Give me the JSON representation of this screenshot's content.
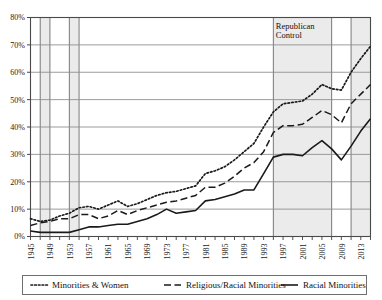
{
  "chart_data": {
    "type": "line",
    "title": "",
    "xlabel": "",
    "ylabel": "",
    "ylim": [
      0,
      80
    ],
    "xlim": [
      1945,
      2015
    ],
    "grid": true,
    "legend_position": "bottom",
    "ytick_labels": [
      "0%",
      "10%",
      "20%",
      "30%",
      "40%",
      "50%",
      "60%",
      "70%",
      "80%"
    ],
    "ytick_values": [
      0,
      10,
      20,
      30,
      40,
      50,
      60,
      70,
      80
    ],
    "xtick_labels": [
      "1945",
      "1949",
      "1953",
      "1957",
      "1961",
      "1965",
      "1969",
      "1973",
      "1977",
      "1981",
      "1985",
      "1989",
      "1993",
      "1997",
      "2001",
      "2005",
      "2009",
      "2013"
    ],
    "xtick_values": [
      1945,
      1949,
      1953,
      1957,
      1961,
      1965,
      1969,
      1973,
      1977,
      1981,
      1985,
      1989,
      1993,
      1997,
      2001,
      2005,
      2009,
      2013
    ],
    "x": [
      1945,
      1947,
      1949,
      1951,
      1953,
      1955,
      1957,
      1959,
      1961,
      1963,
      1965,
      1967,
      1969,
      1971,
      1973,
      1975,
      1977,
      1979,
      1981,
      1983,
      1985,
      1987,
      1989,
      1991,
      1993,
      1995,
      1997,
      1999,
      2001,
      2003,
      2005,
      2007,
      2009,
      2011,
      2013,
      2015
    ],
    "annotations": [
      {
        "text": "Republican Control",
        "x": 1995,
        "y": 78
      }
    ],
    "shaded_bands": [
      {
        "start": 1947,
        "end": 1949,
        "label": "Republican Control"
      },
      {
        "start": 1953,
        "end": 1955,
        "label": "Republican Control"
      },
      {
        "start": 1995,
        "end": 2007,
        "label": "Republican Control"
      },
      {
        "start": 2011,
        "end": 2015,
        "label": "Republican Control"
      }
    ],
    "series": [
      {
        "name": "Minorities & Women",
        "style": "dotted",
        "values": [
          6.5,
          5.5,
          6.0,
          7.5,
          8.5,
          10.5,
          11.0,
          10.0,
          11.5,
          13.0,
          11.0,
          12.0,
          13.5,
          15.0,
          16.0,
          16.5,
          17.5,
          18.5,
          23.0,
          24.0,
          25.5,
          28.0,
          31.0,
          34.0,
          40.0,
          45.5,
          48.5,
          49.0,
          49.5,
          52.0,
          55.5,
          54.0,
          53.5,
          60.0,
          65.0,
          69.5
        ]
      },
      {
        "name": "Religious/Racial Minorities",
        "style": "dashed",
        "values": [
          4.0,
          5.0,
          5.5,
          6.5,
          6.5,
          8.0,
          8.0,
          6.5,
          7.5,
          9.5,
          8.0,
          9.5,
          10.5,
          11.5,
          12.5,
          13.0,
          14.0,
          15.0,
          18.0,
          18.0,
          19.5,
          22.0,
          25.0,
          27.0,
          31.0,
          38.0,
          40.5,
          40.5,
          41.0,
          43.5,
          46.0,
          44.5,
          41.5,
          48.5,
          52.0,
          55.5
        ]
      },
      {
        "name": "Racial Minorities",
        "style": "solid",
        "values": [
          2.0,
          1.5,
          1.5,
          1.5,
          1.5,
          2.5,
          3.5,
          3.5,
          4.0,
          4.5,
          4.5,
          5.5,
          6.5,
          8.0,
          10.0,
          8.5,
          9.0,
          9.5,
          13.0,
          13.5,
          14.5,
          15.5,
          17.0,
          17.0,
          23.0,
          29.0,
          30.0,
          30.0,
          29.5,
          32.5,
          35.0,
          32.0,
          28.0,
          33.0,
          38.5,
          43.0
        ]
      }
    ]
  },
  "legend": {
    "items": [
      {
        "label": "Minorities & Women",
        "style": "dotted"
      },
      {
        "label": "Religious/Racial Minorities",
        "style": "dashed"
      },
      {
        "label": "Racial Minorities",
        "style": "solid"
      }
    ]
  },
  "annotation": {
    "republican_control_line1": "Republican",
    "republican_control_line2": "Control"
  },
  "colors": {
    "line": "#1a1a1a",
    "grid": "#8a8a8a",
    "band": "#ebebeb",
    "axis": "#4a4a4a",
    "background": "#ffffff"
  }
}
